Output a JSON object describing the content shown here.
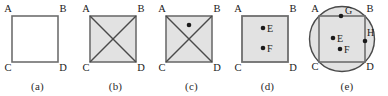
{
  "figure": {
    "kind": "geometry-diagram-strip",
    "panel_count": 5,
    "background_color": "#ffffff",
    "stroke_color": "#6e6e6e",
    "diagonal_color": "#4a4a4a",
    "fill_white": "#ffffff",
    "fill_gray": "#e2e2e2",
    "dot_color": "#1a1a1a",
    "label_color": "#1a1a1a"
  },
  "panels": [
    {
      "id": "a",
      "caption": "(a)",
      "shape": "square",
      "fill": "white",
      "diagonals": false,
      "circle": false,
      "corner_labels": [
        "A",
        "B",
        "C",
        "D"
      ],
      "points": []
    },
    {
      "id": "b",
      "caption": "(b)",
      "shape": "square",
      "fill": "gray",
      "diagonals": true,
      "circle": false,
      "corner_labels": [
        "A",
        "B",
        "C",
        "D"
      ],
      "points": []
    },
    {
      "id": "c",
      "caption": "(c)",
      "shape": "square",
      "fill": "gray",
      "diagonals": true,
      "circle": false,
      "corner_labels": [
        "A",
        "B",
        "C",
        "D"
      ],
      "points": [
        {
          "label": "",
          "x": 0.5,
          "y": 0.18
        }
      ]
    },
    {
      "id": "d",
      "caption": "(d)",
      "shape": "square",
      "fill": "gray",
      "diagonals": false,
      "circle": false,
      "corner_labels": [
        "A",
        "B",
        "C",
        "D"
      ],
      "points": [
        {
          "label": "E",
          "x": 0.46,
          "y": 0.26
        },
        {
          "label": "F",
          "x": 0.46,
          "y": 0.7
        }
      ]
    },
    {
      "id": "e",
      "caption": "(e)",
      "shape": "square",
      "fill": "gray",
      "diagonals": false,
      "circle": true,
      "corner_labels": [
        "A",
        "B",
        "C",
        "D"
      ],
      "points": [
        {
          "label": "G",
          "x": 0.54,
          "y": 0.0
        },
        {
          "label": "E",
          "x": 0.3,
          "y": 0.48
        },
        {
          "label": "F",
          "x": 0.44,
          "y": 0.72
        },
        {
          "label": "H",
          "x": 1.0,
          "y": 0.47
        }
      ]
    }
  ]
}
